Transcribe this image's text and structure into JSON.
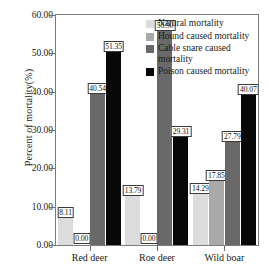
{
  "chart_data": {
    "type": "bar",
    "title": "",
    "xlabel": "",
    "ylabel": "Percent of mortality(%)",
    "categories": [
      "Red deer",
      "Roe deer",
      "Wild boar"
    ],
    "ylim": [
      0,
      60
    ],
    "yticks": [
      "0.00",
      "10.00",
      "20.00",
      "30.00",
      "40.00",
      "50.00",
      "60.00"
    ],
    "ytick_values": [
      0,
      10,
      20,
      30,
      40,
      50,
      60
    ],
    "grid": false,
    "legend_position": "top-right",
    "series": [
      {
        "name": "Natural mortality",
        "color": "#dcdcdc",
        "values": [
          8.11,
          13.79,
          14.29
        ],
        "labels": [
          "8.11",
          "13.79",
          "14.29"
        ]
      },
      {
        "name": "Hound caused mortality",
        "color": "#a9a9a9",
        "values": [
          0.0,
          0.0,
          17.85
        ],
        "labels": [
          "0.00",
          "0.00",
          "17.85"
        ]
      },
      {
        "name": "Cable snare caused mortality",
        "color": "#696969",
        "values": [
          40.54,
          56.9,
          27.79
        ],
        "labels": [
          "40.54",
          "56.90",
          "27.79"
        ]
      },
      {
        "name": "Poison caused mortality",
        "color": "#080808",
        "values": [
          51.35,
          29.31,
          40.07
        ],
        "labels": [
          "51.35",
          "29.31",
          "40.07"
        ]
      }
    ]
  },
  "legend": {
    "items": [
      "Natural mortality",
      "Hound caused mortality",
      "Cable snare caused mortality",
      "Poison caused mortality"
    ]
  }
}
